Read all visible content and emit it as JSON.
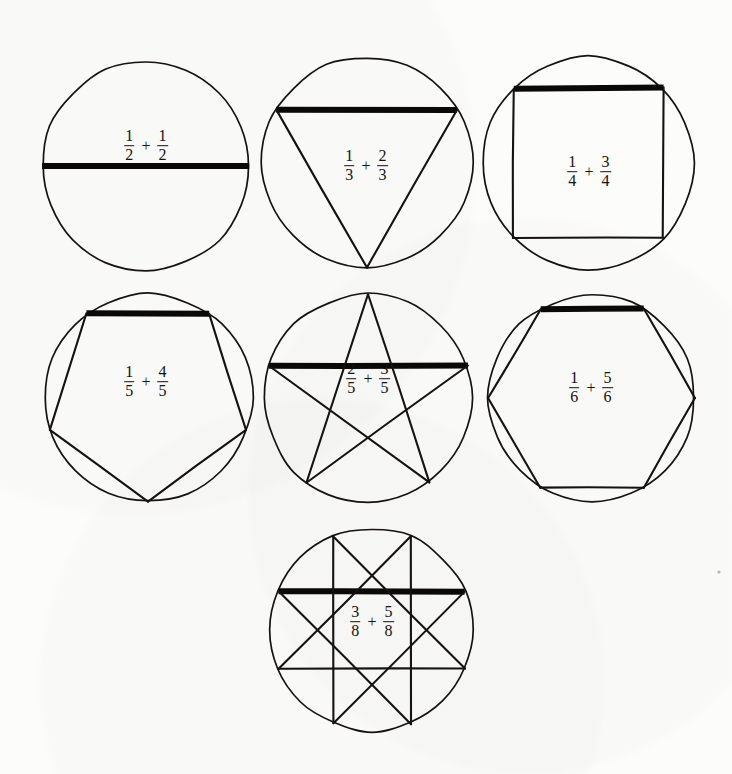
{
  "page": {
    "background_color": "#fcfcfa",
    "ink_color": "#15120f",
    "width": 732,
    "height": 774,
    "medium": "hand-drawn pen on paper"
  },
  "figures": [
    {
      "id": "fig-half",
      "shape_name": "diameter-chord",
      "schlafli": "{2}",
      "sides": 2,
      "step": 1,
      "circle": {
        "cx": 146,
        "cy": 166,
        "r": 104
      },
      "bold_edge_index": 0,
      "label": {
        "x": 146,
        "y": 146,
        "left_num": "1",
        "left_den": "2",
        "operator": "+",
        "right_num": "1",
        "right_den": "2",
        "text": "1/2 + 1/2"
      }
    },
    {
      "id": "fig-third",
      "shape_name": "triangle",
      "schlafli": "{3}",
      "sides": 3,
      "step": 1,
      "circle": {
        "cx": 367,
        "cy": 162,
        "r": 105
      },
      "bold_edge_index": 0,
      "label": {
        "x": 366,
        "y": 166,
        "left_num": "1",
        "left_den": "3",
        "operator": "+",
        "right_num": "2",
        "right_den": "3",
        "text": "1/3 + 2/3"
      }
    },
    {
      "id": "fig-quarter",
      "shape_name": "square",
      "schlafli": "{4}",
      "sides": 4,
      "step": 1,
      "circle": {
        "cx": 588,
        "cy": 163,
        "r": 106
      },
      "bold_edge_index": 0,
      "label": {
        "x": 589,
        "y": 172,
        "left_num": "1",
        "left_den": "4",
        "operator": "+",
        "right_num": "3",
        "right_den": "4",
        "text": "1/4 + 3/4"
      }
    },
    {
      "id": "fig-fifth",
      "shape_name": "pentagon",
      "schlafli": "{5}",
      "sides": 5,
      "step": 1,
      "circle": {
        "cx": 148,
        "cy": 398,
        "r": 104
      },
      "bold_edge_index": 0,
      "label": {
        "x": 146,
        "y": 382,
        "left_num": "1",
        "left_den": "5",
        "operator": "+",
        "right_num": "4",
        "right_den": "5",
        "text": "1/5 + 4/5"
      }
    },
    {
      "id": "fig-two-fifths",
      "shape_name": "pentagram",
      "schlafli": "{5/2}",
      "sides": 5,
      "step": 2,
      "circle": {
        "cx": 368,
        "cy": 398,
        "r": 104
      },
      "bold_edge_index": 0,
      "label": {
        "x": 368,
        "y": 379,
        "left_num": "2",
        "left_den": "5",
        "operator": "+",
        "right_num": "3",
        "right_den": "5",
        "text": "2/5 + 3/5"
      }
    },
    {
      "id": "fig-sixth",
      "shape_name": "hexagon",
      "schlafli": "{6}",
      "sides": 6,
      "step": 1,
      "circle": {
        "cx": 592,
        "cy": 398,
        "r": 103
      },
      "bold_edge_index": 0,
      "label": {
        "x": 591,
        "y": 388,
        "left_num": "1",
        "left_den": "6",
        "operator": "+",
        "right_num": "5",
        "right_den": "6",
        "text": "1/6 + 5/6"
      }
    },
    {
      "id": "fig-three-eighths",
      "shape_name": "octagram",
      "schlafli": "{8/3}",
      "sides": 8,
      "step": 3,
      "circle": {
        "cx": 372,
        "cy": 630,
        "r": 101
      },
      "bold_edge_index": 0,
      "label": {
        "x": 372,
        "y": 622,
        "left_num": "3",
        "left_den": "8",
        "operator": "+",
        "right_num": "5",
        "right_den": "8",
        "text": "3/8 + 5/8"
      }
    }
  ],
  "marks": [
    {
      "name": "paper-speck",
      "x": 719,
      "y": 572,
      "r": 1.6
    }
  ]
}
